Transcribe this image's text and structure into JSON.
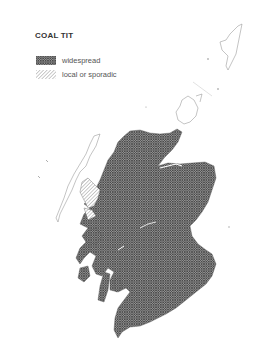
{
  "map": {
    "title": "COAL TIT",
    "legend": [
      {
        "label": "widespread",
        "pattern": "cross-hatch",
        "color": "#555555"
      },
      {
        "label": "local or sporadic",
        "pattern": "diagonal-hatch",
        "color": "#888888"
      }
    ]
  }
}
